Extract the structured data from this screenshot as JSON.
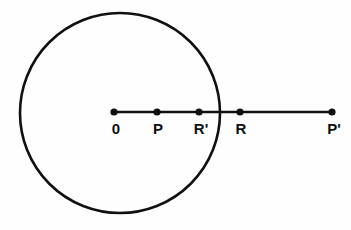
{
  "figure": {
    "kind": "geometry-diagram",
    "background_color": "#fefefe",
    "stroke_color": "#101010",
    "width": 351,
    "height": 230
  },
  "circle": {
    "name": "main-circle",
    "center_x": 120,
    "center_y": 113,
    "radius": 100,
    "stroke_width": 2.6,
    "fill": "none",
    "stroke_color": "#101010"
  },
  "ray": {
    "name": "horizontal-ray",
    "y": 112,
    "x_start": 114,
    "x_end": 333,
    "stroke_width": 2.4,
    "stroke_color": "#101010"
  },
  "points": [
    {
      "id": "origin",
      "label": "0",
      "x": 114,
      "y": 112,
      "label_x": 116,
      "label_y": 121,
      "dot_radius": 3.6
    },
    {
      "id": "p",
      "label": "P",
      "x": 157,
      "y": 112,
      "label_x": 158,
      "label_y": 121,
      "dot_radius": 3.6
    },
    {
      "id": "r-prime",
      "label": "R'",
      "x": 199,
      "y": 112,
      "label_x": 201,
      "label_y": 121,
      "dot_radius": 3.6
    },
    {
      "id": "r",
      "label": "R",
      "x": 240,
      "y": 112,
      "label_x": 241,
      "label_y": 121,
      "dot_radius": 3.6
    },
    {
      "id": "p-prime",
      "label": "P'",
      "x": 332,
      "y": 112,
      "label_x": 334,
      "label_y": 121,
      "dot_radius": 3.6
    }
  ],
  "chart_data": {
    "type": "scatter",
    "xlabel": "",
    "ylabel": "",
    "categories": [
      "0",
      "P",
      "R'",
      "R",
      "P'"
    ],
    "x": [
      114,
      157,
      199,
      240,
      332
    ],
    "y": [
      112,
      112,
      112,
      112,
      112
    ],
    "annotations": [
      "Circle centered at point 0 with radius 100 px",
      "R' lies inside the circle, R lies outside the circle",
      "Ray from 0 through P, R', R to P'"
    ],
    "grid": false,
    "legend": "none"
  }
}
